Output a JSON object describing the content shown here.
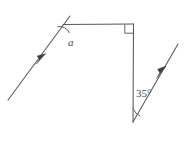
{
  "figure": {
    "background_color": "#ffffff",
    "stroke_color": "#58585a",
    "labels": {
      "angle_a": "a",
      "angle_35": "35°"
    },
    "markers": {
      "right_angle_marker": "right-angle-square",
      "parallel_arrow_left": "arrowhead-marker",
      "parallel_arrow_right": "arrowhead-marker"
    },
    "vertices": {
      "top_left": "(63, 24)",
      "top_right": "(133, 24)",
      "bottom_right": "(133, 122)"
    },
    "segments": [
      {
        "name": "left-transversal",
        "from": "(8, 100)",
        "to": "(70, 16)"
      },
      {
        "name": "top-horizontal",
        "from": "(63, 24)",
        "to": "(133, 24)"
      },
      {
        "name": "right-vertical",
        "from": "(133, 24)",
        "to": "(133, 122)"
      },
      {
        "name": "right-transversal",
        "from": "(133, 122)",
        "to": "(178, 44)"
      }
    ]
  }
}
